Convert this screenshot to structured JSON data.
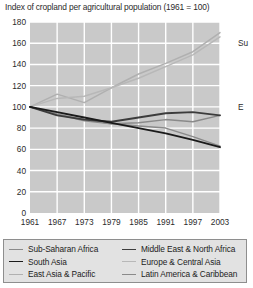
{
  "chart_data": {
    "type": "line",
    "title": "Index of cropland per agricultural population (1961 = 100)",
    "xlabel": "",
    "ylabel": "",
    "xlim": [
      1961,
      2003
    ],
    "ylim": [
      0,
      180
    ],
    "ytick_labels": [
      "0",
      "20",
      "40",
      "60",
      "80",
      "100",
      "120",
      "140",
      "160",
      "180"
    ],
    "yticks": [
      0,
      20,
      40,
      60,
      80,
      100,
      120,
      140,
      160,
      180
    ],
    "xtick_labels": [
      "1961",
      "1967",
      "1973",
      "1979",
      "1985",
      "1991",
      "1997",
      "2003"
    ],
    "xticks": [
      1961,
      1967,
      1973,
      1979,
      1985,
      1991,
      1997,
      2003
    ],
    "grid": true,
    "plot_background": "#c9c9c9",
    "grid_color": "#ffffff",
    "legend_position": "below",
    "x": [
      1961,
      1967,
      1973,
      1979,
      1985,
      1991,
      1997,
      2003
    ],
    "series": [
      {
        "name": "Sub-Saharan Africa",
        "color": "#8a8a8a",
        "width": 1.5,
        "values": [
          100,
          93,
          88,
          84,
          82,
          80,
          72,
          63
        ]
      },
      {
        "name": "South Asia",
        "color": "#1a1a1a",
        "width": 1.8,
        "values": [
          100,
          95,
          90,
          85,
          80,
          75,
          69,
          62
        ]
      },
      {
        "name": "East Asia & Pacific",
        "color": "#b0b0b0",
        "width": 1.5,
        "values": [
          100,
          112,
          104,
          118,
          131,
          141,
          152,
          170
        ]
      },
      {
        "name": "Middle East & North Africa",
        "color": "#3c3c3c",
        "width": 1.8,
        "values": [
          100,
          92,
          88,
          86,
          90,
          94,
          95,
          92
        ]
      },
      {
        "name": "Europe & Central Asia",
        "color": "#b8b8b8",
        "width": 1.5,
        "values": [
          100,
          108,
          110,
          118,
          127,
          138,
          149,
          166
        ]
      },
      {
        "name": "Latin America & Caribbean",
        "color": "#8a8a8a",
        "width": 1.5,
        "values": [
          100,
          93,
          87,
          84,
          85,
          88,
          86,
          92
        ]
      }
    ],
    "edge_annotations": [
      {
        "text": "Su",
        "value_y": 160
      },
      {
        "text": "E",
        "value_y": 100
      }
    ]
  }
}
